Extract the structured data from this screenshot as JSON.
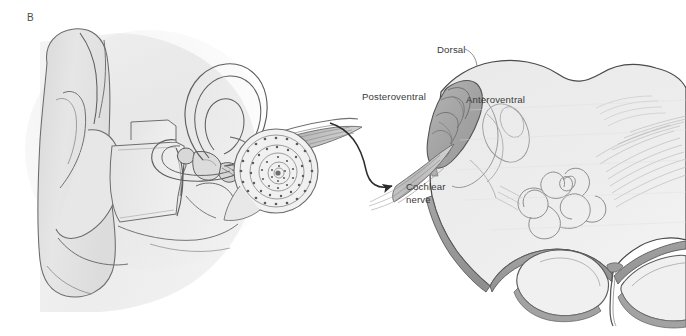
{
  "figure": {
    "panel_letter": "B",
    "background_color": "#ffffff",
    "line_color": "#4f4f4f",
    "label_color": "#3a3a3a",
    "tissue_fill": "#ececed",
    "tissue_fill_mid": "#dedede",
    "nucleus_fill": "#a8a8a8",
    "nucleus_fill_dark": "#949494",
    "edge_band_fill": "#9a9a9a",
    "ear_fill": "#e2e2e2",
    "ear_fill_shadow": "#d2d2d2"
  },
  "labels": {
    "dorsal": "Dorsal",
    "posteroventral": "Posteroventral",
    "anteroventral": "Anteroventral",
    "cochlear_nerve_line1": "Cochlear",
    "cochlear_nerve_line2": "nerve"
  },
  "structures": {
    "pinna": "pinna",
    "ear_canal": "ear-canal",
    "ossicles": "ossicles",
    "semicircular_canals": "semicircular-canals",
    "cochlea": "cochlea",
    "auditory_nerve_bundle": "auditory-nerve-bundle",
    "connector_arrow": "connector-arrow",
    "brainstem": "brainstem-section",
    "cochlear_nucleus_complex": "cochlear-nucleus-complex",
    "inferior_olive": "inferior-olive",
    "pyramids": "medullary-pyramids",
    "fiber_striations": "fiber-striations"
  }
}
